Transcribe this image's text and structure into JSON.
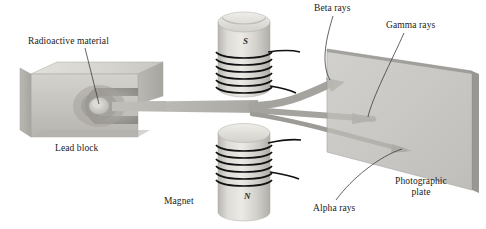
{
  "figure": {
    "background_color": "#ffffff"
  },
  "labels": {
    "radioactive_material": "Radioactive material",
    "lead_block": "Lead block",
    "magnet": "Magnet",
    "beta_rays": "Beta rays",
    "gamma_rays": "Gamma rays",
    "alpha_rays": "Alpha rays",
    "photographic_plate": "Photographic\nplate",
    "photographic_plate_line1": "Photographic",
    "photographic_plate_line2": "plate",
    "pole_south": "S",
    "pole_north": "N"
  },
  "colors": {
    "lead_block_front": "#c9c7c2",
    "lead_block_top": "#d8d6d1",
    "lead_block_side": "#b4b2ad",
    "cavity_dark": "#8f8d88",
    "sample_glow": "#d0cec9",
    "magnet_body": "#cdcbc6",
    "magnet_highlight": "#e6e4df",
    "coil_wire": "#1a1a1a",
    "plate_face": "#b9b7b2",
    "plate_edge": "#9a9893",
    "beam": "#aaa8a3",
    "leader_line": "#3c3c3c",
    "text": "#1a1a1a"
  },
  "components": {
    "lead_block": {
      "description": "3D gray block with U-shaped cavity holding the source"
    },
    "upper_magnet": {
      "pole": "S",
      "coil_turns": 6
    },
    "lower_magnet": {
      "pole": "N",
      "coil_turns": 6
    },
    "photographic_plate": {
      "description": "tilted parallelogram screen at right"
    },
    "rays": [
      {
        "name": "beta",
        "deflection": "upward",
        "impact_y": 84
      },
      {
        "name": "gamma",
        "deflection": "none",
        "impact_y": 117
      },
      {
        "name": "alpha",
        "deflection": "downward",
        "impact_y": 150
      }
    ]
  }
}
